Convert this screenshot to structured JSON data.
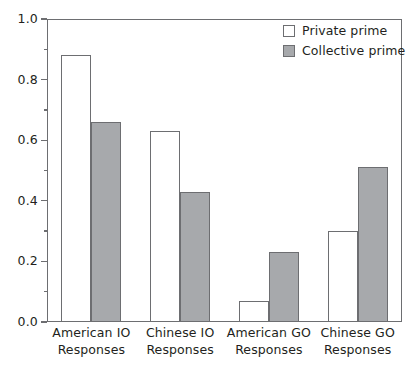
{
  "chart_data": {
    "type": "bar",
    "title": "",
    "subtitle": "",
    "xlabel": "",
    "ylabel": "",
    "ylim": [
      0.0,
      1.0
    ],
    "grid": false,
    "legend_position": "top-right",
    "categories": [
      "American IO Responses",
      "Chinese IO Responses",
      "American GO Responses",
      "Chinese GO Responses"
    ],
    "category_lines": [
      [
        "American IO",
        "Responses"
      ],
      [
        "Chinese IO",
        "Responses"
      ],
      [
        "American GO",
        "Responses"
      ],
      [
        "Chinese GO",
        "Responses"
      ]
    ],
    "series": [
      {
        "name": "Private prime",
        "color": "#ffffff",
        "values": [
          0.88,
          0.63,
          0.07,
          0.3
        ]
      },
      {
        "name": "Collective prime",
        "color": "#a7a9ac",
        "values": [
          0.66,
          0.43,
          0.23,
          0.51
        ]
      }
    ],
    "y_ticks_major": [
      "0.0",
      "0.2",
      "0.4",
      "0.6",
      "0.8",
      "1.0"
    ],
    "y_ticks_major_values": [
      0.0,
      0.2,
      0.4,
      0.6,
      0.8,
      1.0
    ],
    "y_ticks_minor_values": [
      0.1,
      0.3,
      0.5,
      0.7,
      0.9
    ],
    "axis_color": "#6d6e71",
    "text_color": "#231f20",
    "background_color": "#ffffff"
  },
  "legend": {
    "items": [
      {
        "label": "Private prime",
        "swatch": "private"
      },
      {
        "label": "Collective prime",
        "swatch": "collective"
      }
    ]
  }
}
